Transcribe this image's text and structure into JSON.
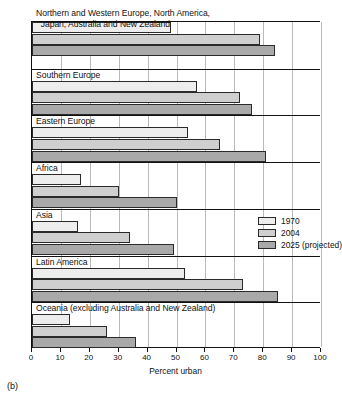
{
  "panel": {
    "caption": "(b)"
  },
  "axis": {
    "xlabel": "Percent urban",
    "ticks": [
      "0",
      "10",
      "20",
      "30",
      "40",
      "50",
      "60",
      "70",
      "80",
      "90",
      "100"
    ]
  },
  "legend": {
    "items": [
      {
        "label": "1970",
        "color": "#ededed"
      },
      {
        "label": "2004",
        "color": "#cfcfcf"
      },
      {
        "label": "2025 (projected)",
        "color": "#a9a9a9"
      }
    ]
  },
  "groups": [
    {
      "label": "Northern and Western Europe, North America,\n  Japan, Australia and New Zealand"
    },
    {
      "label": "Southern Europe"
    },
    {
      "label": "Eastern Europe"
    },
    {
      "label": "Africa"
    },
    {
      "label": "Asia"
    },
    {
      "label": "Latin America"
    },
    {
      "label": "Oceania (excluding Australia and New Zealand)"
    }
  ],
  "chart_data": {
    "type": "bar",
    "orientation": "horizontal",
    "title": "",
    "xlabel": "Percent urban",
    "ylabel": "",
    "xlim": [
      0,
      100
    ],
    "xticks": [
      0,
      10,
      20,
      30,
      40,
      50,
      60,
      70,
      80,
      90,
      100
    ],
    "grid": "vertical",
    "legend_position": "middle-right-inside",
    "categories": [
      "Northern and Western Europe, North America, Japan, Australia and New Zealand",
      "Southern Europe",
      "Eastern Europe",
      "Africa",
      "Asia",
      "Latin America",
      "Oceania (excluding Australia and New Zealand)"
    ],
    "series": [
      {
        "name": "1970",
        "color": "#ededed",
        "values": [
          48,
          57,
          54,
          17,
          16,
          53,
          13
        ]
      },
      {
        "name": "2004",
        "color": "#cfcfcf",
        "values": [
          79,
          72,
          65,
          30,
          34,
          73,
          26
        ]
      },
      {
        "name": "2025 (projected)",
        "color": "#a9a9a9",
        "values": [
          84,
          76,
          81,
          50,
          49,
          85,
          36
        ]
      }
    ]
  }
}
